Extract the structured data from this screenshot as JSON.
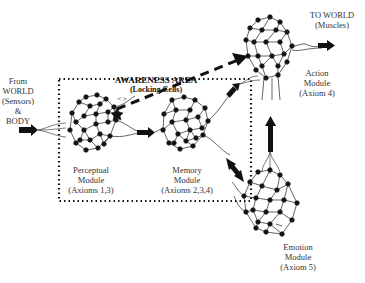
{
  "diagram": {
    "awareness_area": {
      "title": "AWARENESS AREA",
      "subtitle": "(Locking Cells)"
    },
    "input": {
      "lines": [
        "From",
        "WORLD",
        "(Sensors)",
        "&",
        "BODY"
      ]
    },
    "output": {
      "lines": [
        "TO WORLD",
        "(Muscles)"
      ]
    },
    "modules": [
      {
        "id": "perceptual",
        "lines": [
          "Perceptual",
          "Module",
          "(Axioms 1,3)"
        ]
      },
      {
        "id": "memory",
        "lines": [
          "Memory",
          "Module",
          "(Axioms 2,3,4)"
        ]
      },
      {
        "id": "action",
        "lines": [
          "Action",
          "Module",
          "(Axiom 4)"
        ]
      },
      {
        "id": "emotion",
        "lines": [
          "Emotion",
          "Module",
          "(Axiom 5)"
        ]
      }
    ],
    "annotations": {
      "locking_marker": "< >"
    },
    "colors": {
      "line": "#111111",
      "text": "#333333",
      "background": "#ffffff"
    }
  }
}
